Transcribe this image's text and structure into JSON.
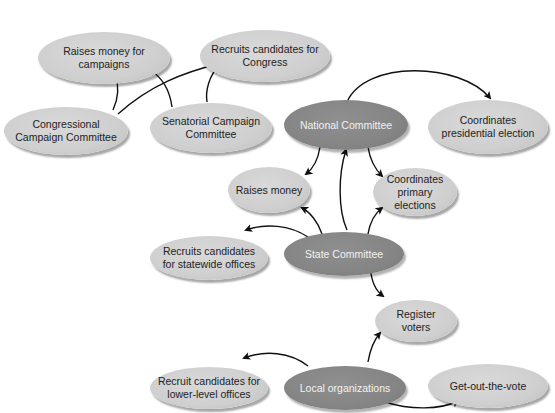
{
  "diagram": {
    "nodes": {
      "raises_money_campaigns": "Raises money for campaigns",
      "recruits_candidates_congress": "Recruits candidates for Congress",
      "congressional_campaign_committee": "Congressional Campaign Committee",
      "senatorial_campaign_committee": "Senatorial Campaign Committee",
      "national_committee": "National Committee",
      "coordinates_presidential_election": "Coordinates presidential election",
      "raises_money": "Raises money",
      "coordinates_primary_elections": "Coordinates primary elections",
      "recruits_candidates_statewide": "Recruits candidates for statewide offices",
      "state_committee": "State Committee",
      "register_voters": "Register voters",
      "recruit_candidates_lower_level": "Recruit candidates for lower-level offices",
      "local_organizations": "Local organizations",
      "get_out_the_vote": "Get-out-the-vote"
    },
    "edges": [
      {
        "from": "Congressional Campaign Committee",
        "to": "Raises money for campaigns"
      },
      {
        "from": "Congressional Campaign Committee",
        "to": "Recruits candidates for Congress"
      },
      {
        "from": "Senatorial Campaign Committee",
        "to": "Raises money for campaigns"
      },
      {
        "from": "Senatorial Campaign Committee",
        "to": "Recruits candidates for Congress"
      },
      {
        "from": "National Committee",
        "to": "Coordinates presidential election"
      },
      {
        "from": "National Committee",
        "to": "Raises money"
      },
      {
        "from": "National Committee",
        "to": "Coordinates primary elections"
      },
      {
        "from": "State Committee",
        "to": "National Committee"
      },
      {
        "from": "State Committee",
        "to": "Raises money"
      },
      {
        "from": "State Committee",
        "to": "Coordinates primary elections"
      },
      {
        "from": "State Committee",
        "to": "Recruits candidates for statewide offices"
      },
      {
        "from": "State Committee",
        "to": "Register voters"
      },
      {
        "from": "Local organizations",
        "to": "Register voters"
      },
      {
        "from": "Local organizations",
        "to": "Recruit candidates for lower-level offices"
      },
      {
        "from": "Local organizations",
        "to": "Get-out-the-vote"
      }
    ],
    "colors": {
      "primary_node": "#858585",
      "secondary_node": "#cfcfcf",
      "edge": "#111111"
    }
  }
}
